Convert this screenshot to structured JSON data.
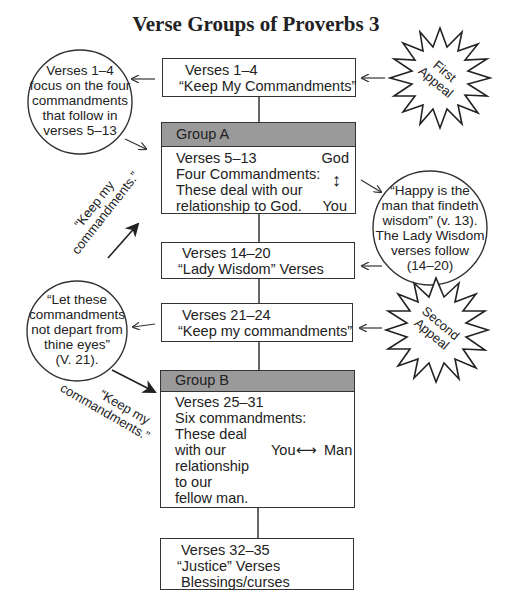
{
  "title": "Verse Groups of Proverbs 3",
  "flow": {
    "box1": {
      "line1": "Verses 1–4",
      "line2": "“Keep My Commandments”"
    },
    "groupA": {
      "header": "Group A",
      "lines": [
        "Verses 5–13",
        "Four Commandments:",
        "These deal with our",
        "relationship to God."
      ],
      "relation": {
        "top": "God",
        "bottom": "You",
        "arrow": "↕"
      }
    },
    "box3": {
      "line1": "Verses 14–20",
      "line2": "“Lady Wisdom” Verses"
    },
    "box4": {
      "line1": "Verses 21–24",
      "line2": "“Keep my commandments”"
    },
    "groupB": {
      "header": "Group B",
      "lines": [
        "Verses 25–31",
        "Six commandments:",
        "These deal",
        "with our",
        "relationship",
        "to our",
        "fellow man."
      ],
      "relation": {
        "left": "You",
        "right": "Man",
        "arrow": "⟷"
      }
    },
    "box6": {
      "line1": "Verses 32–35",
      "line2": "“Justice” Verses",
      "line3": "Blessings/curses"
    }
  },
  "annotations": {
    "circle_left_1": {
      "lines": [
        "Verses 1–4",
        "focus on the four",
        "commandments",
        "that follow in",
        "verses 5–13"
      ]
    },
    "circle_right": {
      "lines": [
        "“Happy is the",
        "man that findeth",
        "wisdom” (v. 13).",
        "The Lady Wisdom",
        "verses follow",
        "(14–20)"
      ]
    },
    "circle_left_2": {
      "lines": [
        "“Let these",
        "commandments",
        "not depart from",
        "thine eyes”",
        "(V. 21)."
      ]
    },
    "starburst_1": {
      "line1": "First",
      "line2": "Appeal"
    },
    "starburst_2": {
      "line1": "Second",
      "line2": "Appeal"
    },
    "rotated_quote_1": {
      "line1": "“Keep my",
      "line2": "commandments.”"
    },
    "rotated_quote_2": {
      "line1": "“Keep my",
      "line2": "commandments.”"
    }
  },
  "colors": {
    "group_header": "#9a9a9a",
    "stroke": "#333333"
  }
}
